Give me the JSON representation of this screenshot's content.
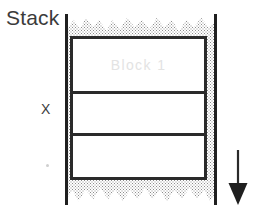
{
  "diagram": {
    "title_label": "Stack",
    "axis_label": "X",
    "block_label": "Block 1",
    "arrow": {
      "name": "downward-growth-arrow",
      "direction": "down"
    },
    "cells": [
      {
        "label": "Block 1",
        "filled": true
      },
      {
        "label": "",
        "filled": false
      },
      {
        "label": "",
        "filled": false
      }
    ],
    "colors": {
      "line": "#2a2a2a",
      "rail": "#1f1f1f",
      "stipple": "#8d8d8d",
      "block_text": "#e3e3e3",
      "label_text": "#3b3b3b",
      "background": "#ffffff"
    }
  }
}
